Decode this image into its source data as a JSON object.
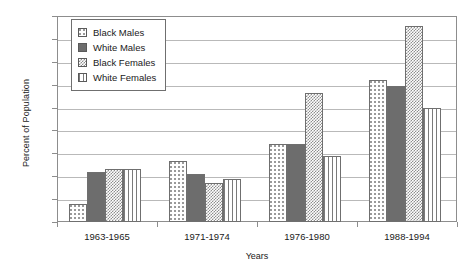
{
  "chart_data": {
    "type": "bar",
    "title": "",
    "xlabel": "Years",
    "ylabel": "Percent of Population",
    "categories": [
      "1963-1965",
      "1971-1974",
      "1976-1980",
      "1988-1994"
    ],
    "series": [
      {
        "name": "Black Males",
        "pattern": "sparse-dots",
        "values": [
          1.6,
          5.3,
          6.8,
          12.4
        ]
      },
      {
        "name": "White Males",
        "pattern": "solid-gray",
        "values": [
          4.4,
          4.2,
          6.8,
          11.9
        ]
      },
      {
        "name": "Black Females",
        "pattern": "checkerboard",
        "values": [
          4.6,
          3.4,
          11.3,
          17.1
        ]
      },
      {
        "name": "White Females",
        "pattern": "vertical-stripes",
        "values": [
          4.6,
          3.8,
          5.8,
          10.0
        ]
      }
    ],
    "ylim": [
      0,
      18
    ],
    "yticks": [
      0,
      2,
      4,
      6,
      8,
      10,
      12,
      14,
      16,
      18
    ],
    "ytick_labels": [
      "0",
      "2",
      "4",
      "6",
      "8",
      "10",
      "12",
      "14",
      "16",
      "18"
    ],
    "grid": true,
    "grid_axis": "y",
    "legend_position": "top-left",
    "colors": {
      "axis": "#8d8d8d",
      "grid": "#b9b9b9",
      "bar_outline": "#6f6f6f",
      "solid_fill": "#6d6d6d",
      "text": "#1a1a1a",
      "background": "#ffffff"
    }
  }
}
